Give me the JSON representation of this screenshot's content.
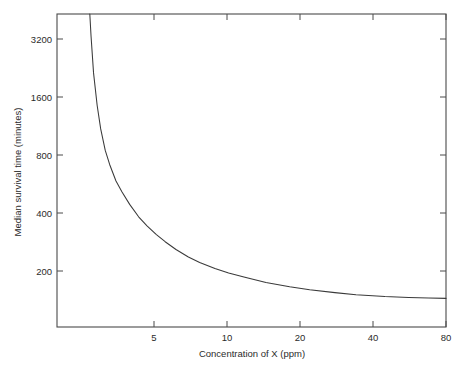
{
  "chart_data": {
    "type": "line",
    "title": "",
    "xlabel": "Concentration of X (ppm)",
    "ylabel": "Median survival time (minutes)",
    "xscale": "log",
    "yscale": "log",
    "xlim": [
      4.0,
      80.0
    ],
    "ylim": [
      150,
      4330
    ],
    "xticks": [
      5,
      10,
      20,
      40,
      80
    ],
    "xticklabels": [
      "5",
      "10",
      "20",
      "40",
      "80"
    ],
    "yticks": [
      200,
      400,
      800,
      1600,
      3200
    ],
    "yticklabels": [
      "200",
      "400",
      "800",
      "1600",
      "3200"
    ],
    "grid": false,
    "legend": null,
    "box": true,
    "ticks_all_sides": true,
    "series": [
      {
        "name": "Median survival time",
        "x": [
          5.15,
          5.2,
          5.3,
          5.45,
          5.6,
          5.8,
          6.0,
          6.3,
          6.6,
          7.0,
          7.5,
          8.0,
          8.6,
          9.2,
          10.0,
          11.0,
          12.0,
          13.5,
          15.0,
          17.0,
          20.0,
          24.0,
          28.0,
          34.0,
          40.0,
          50.0,
          60.0,
          70.0,
          80.0
        ],
        "y": [
          4330,
          3400,
          2300,
          1620,
          1260,
          1000,
          860,
          720,
          640,
          560,
          490,
          445,
          405,
          375,
          345,
          318,
          300,
          281,
          268,
          256,
          242,
          231,
          224,
          217,
          212,
          208,
          206,
          205,
          204
        ]
      }
    ],
    "annotations": []
  },
  "colors": {
    "axis": "#4a4a4a",
    "curve": "#3a3a3a",
    "text": "#2b2b2b",
    "background": "#ffffff"
  },
  "geometry": {
    "plot_left": 57,
    "plot_right": 446,
    "plot_top": 14,
    "plot_bottom": 327
  }
}
